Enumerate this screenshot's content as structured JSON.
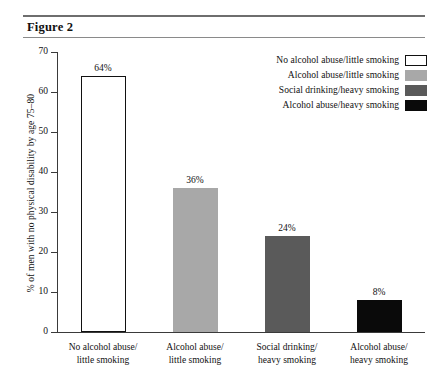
{
  "figure": {
    "title": "Figure 2"
  },
  "legend": {
    "position": "top-right",
    "items": [
      {
        "label": "No alcohol abuse/little smoking",
        "color": "#ffffff",
        "border": "#111111"
      },
      {
        "label": "Alcohol abuse/little smoking",
        "color": "#a8a8a8",
        "border": "#a8a8a8"
      },
      {
        "label": "Social drinking/heavy smoking",
        "color": "#5a5a5a",
        "border": "#5a5a5a"
      },
      {
        "label": "Alcohol abuse/heavy smoking",
        "color": "#0a0a0a",
        "border": "#0a0a0a"
      }
    ]
  },
  "chart_data": {
    "type": "bar",
    "title": "Figure 2",
    "xlabel": "",
    "ylabel": "% of men with no physical disability by age 75–80",
    "ylim": [
      0,
      70
    ],
    "yticks": [
      0,
      10,
      20,
      30,
      40,
      50,
      60,
      70
    ],
    "ytick_labels": [
      "0",
      "10",
      "20",
      "30",
      "40",
      "50",
      "60",
      "70"
    ],
    "grid": false,
    "categories": [
      "No alcohol abuse/\nlittle smoking",
      "Alcohol abuse/\nlittle smoking",
      "Social drinking/\nheavy smoking",
      "Alcohol abuse/\nheavy smoking"
    ],
    "category_lines": [
      [
        "No alcohol abuse/",
        "little smoking"
      ],
      [
        "Alcohol abuse/",
        "little smoking"
      ],
      [
        "Social drinking/",
        "heavy smoking"
      ],
      [
        "Alcohol abuse/",
        "heavy smoking"
      ]
    ],
    "values": [
      64,
      36,
      24,
      8
    ],
    "data_labels": [
      "64%",
      "36%",
      "24%",
      "8%"
    ],
    "colors": [
      "#ffffff",
      "#a8a8a8",
      "#5a5a5a",
      "#0a0a0a"
    ],
    "bar_borders": [
      "#111111",
      "#a8a8a8",
      "#5a5a5a",
      "#0a0a0a"
    ]
  }
}
